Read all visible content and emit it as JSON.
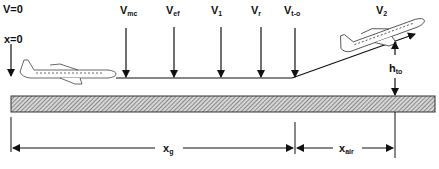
{
  "labels": {
    "v_zero": "V=0",
    "x_zero": "x=0",
    "v_mc": {
      "main": "V",
      "sub": "mc"
    },
    "v_ef": {
      "main": "V",
      "sub": "ef"
    },
    "v_1": {
      "main": "V",
      "sub": "1"
    },
    "v_r": {
      "main": "V",
      "sub": "r"
    },
    "v_to": {
      "main": "V",
      "sub": "t-o"
    },
    "v_2": {
      "main": "V",
      "sub": "2"
    },
    "h_to": {
      "main": "h",
      "sub": "to"
    },
    "x_g": {
      "main": "x",
      "sub": "g"
    },
    "x_air": {
      "main": "x",
      "sub": "air"
    }
  },
  "colors": {
    "line": "#111111",
    "runway_fill": "#bdbdbd",
    "runway_hatch": "#555555"
  }
}
